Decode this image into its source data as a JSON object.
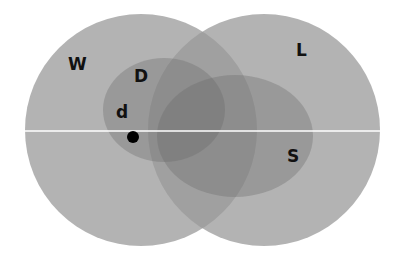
{
  "diagram": {
    "type": "venn",
    "sets": [
      {
        "id": "W",
        "label": "W",
        "shape": "circle",
        "cx": 141,
        "cy": 130,
        "r": 116
      },
      {
        "id": "L",
        "label": "L",
        "shape": "circle",
        "cx": 264,
        "cy": 130,
        "r": 116
      },
      {
        "id": "D",
        "label": "D",
        "shape": "ellipse",
        "cx": 164,
        "cy": 110,
        "rx": 61,
        "ry": 52
      },
      {
        "id": "S",
        "label": "S",
        "shape": "ellipse",
        "cx": 235,
        "cy": 136,
        "rx": 78,
        "ry": 61
      }
    ],
    "point": {
      "label": "d",
      "cx": 133,
      "cy": 137,
      "r": 6
    },
    "horizontal_line_y": 131,
    "colors": {
      "fill": "#6e6e6e",
      "point": "#000000",
      "line": "#ffffff",
      "text": "#111111"
    }
  },
  "labels": {
    "W": "W",
    "L": "L",
    "D": "D",
    "S": "S",
    "d": "d"
  }
}
